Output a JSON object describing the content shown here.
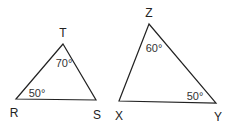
{
  "triangles": [
    {
      "name": "RST",
      "vertices": {
        "top": "T",
        "left": "R",
        "right": "S"
      },
      "angles": {
        "top": "70°",
        "left": "50°"
      }
    },
    {
      "name": "XYZ",
      "vertices": {
        "top": "Z",
        "left": "X",
        "right": "Y"
      },
      "angles": {
        "top": "60°",
        "right": "50°"
      }
    }
  ]
}
